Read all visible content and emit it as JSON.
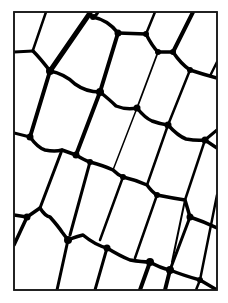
{
  "figure": {
    "title": "",
    "colors": {
      "background": "#ffffff",
      "wall": "#000000",
      "frame": "#1a1a1a"
    },
    "frame": {
      "x": 14,
      "y": 12,
      "width": 203,
      "height": 278
    },
    "walls": [
      {
        "d": "M46,12 L33,50",
        "w": 2.5
      },
      {
        "d": "M14,52 L33,51",
        "w": 3
      },
      {
        "d": "M33,51 Q40,58 50,71",
        "w": 3.5
      },
      {
        "d": "M50,71 L90,13",
        "w": 5
      },
      {
        "d": "M88,12 Q90,16 93,17 Q96,16 98,12",
        "w": 3
      },
      {
        "d": "M93,17 Q108,20 118,33",
        "w": 3.5
      },
      {
        "d": "M118,33 L146,34",
        "w": 3.5
      },
      {
        "d": "M146,34 L155,12",
        "w": 2.5
      },
      {
        "d": "M146,34 Q152,46 158,52",
        "w": 3.5
      },
      {
        "d": "M158,52 L173,52",
        "w": 3.5
      },
      {
        "d": "M173,52 L193,12",
        "w": 4
      },
      {
        "d": "M173,52 Q181,64 190,70",
        "w": 3.5
      },
      {
        "d": "M190,70 Q202,74 217,78",
        "w": 3.5
      },
      {
        "d": "M210,76 L217,62",
        "w": 2.5
      },
      {
        "d": "M50,71 Q65,74 75,84 Q86,92 100,92",
        "w": 3.5
      },
      {
        "d": "M118,33 L100,92",
        "w": 4
      },
      {
        "d": "M158,52 L137,108",
        "w": 1.8
      },
      {
        "d": "M190,70 L168,125",
        "w": 2.5
      },
      {
        "d": "M100,92 Q110,100 116,106 Q126,110 137,108",
        "w": 3.5
      },
      {
        "d": "M137,108 Q145,118 152,121 Q160,124 168,125",
        "w": 3.5
      },
      {
        "d": "M168,125 Q178,136 186,139 Q197,141 205,140 L217,148",
        "w": 3.5
      },
      {
        "d": "M217,130 L205,140",
        "w": 3
      },
      {
        "d": "M50,71 L30,137",
        "w": 4
      },
      {
        "d": "M14,133 L30,137",
        "w": 3
      },
      {
        "d": "M100,92 L76,155",
        "w": 4
      },
      {
        "d": "M137,108 L113,170",
        "w": 1.5
      },
      {
        "d": "M168,125 L147,185",
        "w": 2.5
      },
      {
        "d": "M205,140 L185,200",
        "w": 2.5
      },
      {
        "d": "M30,137 Q38,148 45,150 Q55,152 62,150 L76,155",
        "w": 3.5
      },
      {
        "d": "M76,155 Q84,160 90,162",
        "w": 3.5
      },
      {
        "d": "M90,162 Q105,166 113,170 Q118,175 123,177",
        "w": 3.5
      },
      {
        "d": "M123,177 Q136,180 147,185 Q152,192 157,195",
        "w": 3.5
      },
      {
        "d": "M157,195 Q172,198 185,200 Q188,210 190,217",
        "w": 3.5
      },
      {
        "d": "M190,217 Q205,222 217,228",
        "w": 3.5
      },
      {
        "d": "M62,150 L40,208",
        "w": 3
      },
      {
        "d": "M90,162 L70,235",
        "w": 3
      },
      {
        "d": "M123,177 L100,240",
        "w": 2.5
      },
      {
        "d": "M157,195 L135,258",
        "w": 2.5
      },
      {
        "d": "M190,217 L170,270",
        "w": 3
      },
      {
        "d": "M217,195 L200,280",
        "w": 2.5
      },
      {
        "d": "M14,215 L27,217 L40,208",
        "w": 3.5
      },
      {
        "d": "M40,208 Q45,216 50,217 Q58,226 62,232 L68,240",
        "w": 3.5
      },
      {
        "d": "M68,240 Q78,236 83,235 Q95,245 107,248",
        "w": 3.5
      },
      {
        "d": "M107,248 Q120,256 130,260 Q142,262 150,262",
        "w": 3.5
      },
      {
        "d": "M150,262 Q160,268 170,270 Q182,275 200,280 L217,290",
        "w": 3.5
      },
      {
        "d": "M14,245 L27,217",
        "w": 3.5
      },
      {
        "d": "M68,240 L57,290",
        "w": 3
      },
      {
        "d": "M107,248 L95,290",
        "w": 3
      },
      {
        "d": "M150,262 L140,290",
        "w": 4
      },
      {
        "d": "M170,270 L165,290",
        "w": 4
      },
      {
        "d": "M200,280 L196,290",
        "w": 2.5
      },
      {
        "d": "M185,200 L172,262",
        "w": 2
      }
    ],
    "nodes": [
      {
        "cx": 50,
        "cy": 71,
        "r": 4
      },
      {
        "cx": 93,
        "cy": 17,
        "r": 3
      },
      {
        "cx": 118,
        "cy": 33,
        "r": 3.5
      },
      {
        "cx": 146,
        "cy": 34,
        "r": 3
      },
      {
        "cx": 158,
        "cy": 52,
        "r": 3
      },
      {
        "cx": 173,
        "cy": 52,
        "r": 3
      },
      {
        "cx": 190,
        "cy": 70,
        "r": 3
      },
      {
        "cx": 100,
        "cy": 92,
        "r": 4
      },
      {
        "cx": 137,
        "cy": 108,
        "r": 3.5
      },
      {
        "cx": 168,
        "cy": 125,
        "r": 3.5
      },
      {
        "cx": 205,
        "cy": 140,
        "r": 3.5
      },
      {
        "cx": 30,
        "cy": 137,
        "r": 3.5
      },
      {
        "cx": 76,
        "cy": 155,
        "r": 3.5
      },
      {
        "cx": 90,
        "cy": 162,
        "r": 3
      },
      {
        "cx": 123,
        "cy": 177,
        "r": 3
      },
      {
        "cx": 157,
        "cy": 195,
        "r": 3
      },
      {
        "cx": 190,
        "cy": 217,
        "r": 3.5
      },
      {
        "cx": 27,
        "cy": 217,
        "r": 3.5
      },
      {
        "cx": 68,
        "cy": 240,
        "r": 4
      },
      {
        "cx": 107,
        "cy": 248,
        "r": 3.5
      },
      {
        "cx": 150,
        "cy": 262,
        "r": 4
      },
      {
        "cx": 170,
        "cy": 270,
        "r": 4
      },
      {
        "cx": 200,
        "cy": 280,
        "r": 3
      }
    ]
  }
}
